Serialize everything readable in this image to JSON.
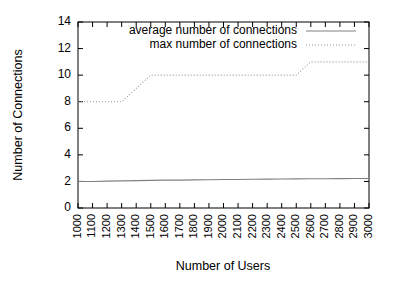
{
  "chart_data": {
    "type": "line",
    "title": "",
    "xlabel": "Number of Users",
    "ylabel": "Number of Connections",
    "xlim": [
      1000,
      3000
    ],
    "ylim": [
      0,
      14
    ],
    "grid": false,
    "legend_position": "top-center",
    "x_ticks": [
      1000,
      1100,
      1200,
      1300,
      1400,
      1500,
      1600,
      1700,
      1800,
      1900,
      2000,
      2100,
      2200,
      2300,
      2400,
      2500,
      2600,
      2700,
      2800,
      2900,
      3000
    ],
    "x_tick_labels": [
      "1000",
      "1100",
      "1200",
      "1300",
      "1400",
      "1500",
      "1600",
      "1700",
      "1800",
      "1900",
      "2000",
      "2100",
      "2200",
      "2300",
      "2400",
      "2500",
      "2600",
      "2700",
      "2800",
      "2900",
      "3000"
    ],
    "y_ticks": [
      0,
      2,
      4,
      6,
      8,
      10,
      12,
      14
    ],
    "y_tick_labels": [
      "0",
      "2",
      "4",
      "6",
      "8",
      "10",
      "12",
      "14"
    ],
    "x": [
      1000,
      1100,
      1200,
      1300,
      1400,
      1500,
      1600,
      1700,
      1800,
      1900,
      2000,
      2100,
      2200,
      2300,
      2400,
      2500,
      2600,
      2700,
      2800,
      2900,
      3000
    ],
    "series": [
      {
        "name": "average number of connections",
        "style": "solid",
        "color": "#808080",
        "values": [
          2.0,
          2.0,
          2.02,
          2.04,
          2.06,
          2.08,
          2.1,
          2.1,
          2.12,
          2.13,
          2.14,
          2.15,
          2.16,
          2.17,
          2.18,
          2.19,
          2.2,
          2.2,
          2.21,
          2.22,
          2.22
        ]
      },
      {
        "name": "max number of connections",
        "style": "dotted",
        "color": "#9a9a9a",
        "values": [
          8,
          8,
          8,
          8,
          9,
          10,
          10,
          10,
          10,
          10,
          10,
          10,
          10,
          10,
          10,
          10,
          11,
          11,
          11,
          11,
          11
        ]
      }
    ]
  },
  "legend": {
    "entries": [
      {
        "label": "average number of connections",
        "style": "solid"
      },
      {
        "label": "max number of connections",
        "style": "dotted"
      }
    ]
  },
  "axes": {
    "x_title": "Number of Users",
    "y_title": "Number of Connections"
  }
}
